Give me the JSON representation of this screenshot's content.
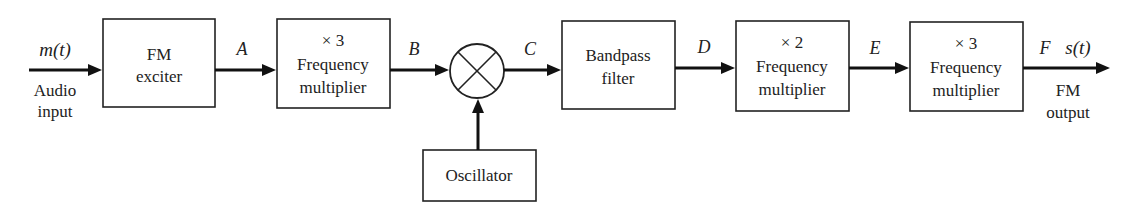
{
  "diagram": {
    "input": {
      "signal": "m(t)",
      "caption_line1": "Audio",
      "caption_line2": "input"
    },
    "output": {
      "signal": "s(t)",
      "caption_line1": "FM",
      "caption_line2": "output"
    },
    "blocks": [
      {
        "id": "fm-exciter",
        "line1": "FM",
        "line2": "exciter"
      },
      {
        "id": "mult1",
        "factor": "× 3",
        "line1": "Frequency",
        "line2": "multiplier"
      },
      {
        "id": "mixer",
        "symbol": "mixer-cross"
      },
      {
        "id": "bandpass",
        "line1": "Bandpass",
        "line2": "filter"
      },
      {
        "id": "mult2",
        "factor": "× 2",
        "line1": "Frequency",
        "line2": "multiplier"
      },
      {
        "id": "mult3",
        "factor": "× 3",
        "line1": "Frequency",
        "line2": "multiplier"
      },
      {
        "id": "oscillator",
        "line1": "Oscillator"
      }
    ],
    "nodes": {
      "a": "A",
      "b": "B",
      "c": "C",
      "d": "D",
      "e": "E",
      "f": "F"
    }
  }
}
